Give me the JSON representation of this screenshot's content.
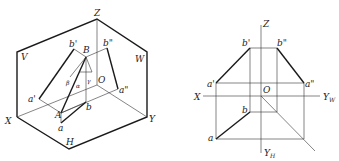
{
  "left_figure": {
    "title": "axonometric view",
    "labels": {
      "Z": "Z",
      "V": "V",
      "W": "W",
      "X": "X",
      "Y": "Y",
      "H": "H",
      "O": "O",
      "b_prime": "b'",
      "B": "B",
      "b_dprime": "b\"",
      "a_prime": "a'",
      "a_dprime": "a\"",
      "A": "A",
      "a": "a",
      "b": "b",
      "alpha": "α",
      "beta": "β",
      "gamma": "γ"
    }
  },
  "right_figure": {
    "title": "orthographic projection",
    "labels": {
      "Z": "Z",
      "X": "X",
      "O": "O",
      "YW": "Y",
      "YW_sub": "W",
      "YH": "Y",
      "YH_sub": "H",
      "b_prime": "b'",
      "b_dprime": "b\"",
      "a_prime": "a'",
      "a_dprime": "a\"",
      "a": "a",
      "b": "b"
    }
  }
}
